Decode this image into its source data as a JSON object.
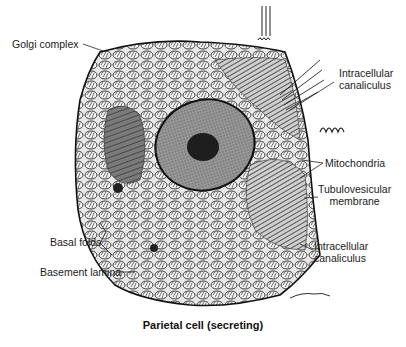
{
  "figure": {
    "title": "Parietal cell (secreting)",
    "labels": [
      {
        "id": "golgi",
        "text": "Golgi complex"
      },
      {
        "id": "intracellular_canaliculus_top",
        "text": "Intracellular\ncanaliculus"
      },
      {
        "id": "mitochondria",
        "text": "Mitochondria"
      },
      {
        "id": "tubulovesicular",
        "text": "Tubulovesicular\nmembrane"
      },
      {
        "id": "intracellular_canaliculus_bottom",
        "text": "Intracellular\ncanaliculus"
      },
      {
        "id": "basal_folds",
        "text": "Basal folds"
      },
      {
        "id": "basement_lamina",
        "text": "Basement lamina"
      }
    ],
    "colors": {
      "ink": "#1a1a1a",
      "cytoplasm": "#d9d9d9",
      "nucleus": "#8c8c8c",
      "nucleolus": "#1e1e1e",
      "background": "#ffffff"
    }
  }
}
